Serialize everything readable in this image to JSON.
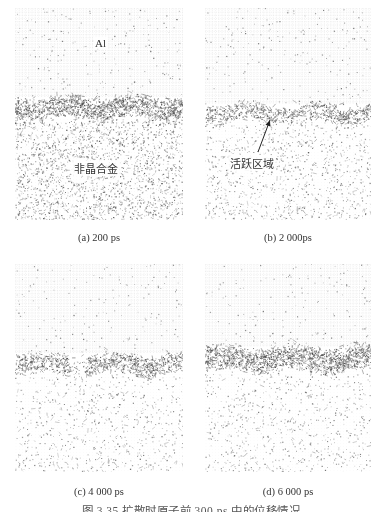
{
  "figure": {
    "caption": "图 3.35  扩散时原子前 300 ps 中的位移情况",
    "panels": [
      {
        "id": "a",
        "label": "(a) 200 ps",
        "x": 15,
        "y": 8,
        "w": 168,
        "h": 212,
        "interface_y": 100,
        "band_thickness": 22,
        "band_density": 1.0,
        "lower_density": 0.75,
        "upper_density": 0.12,
        "gap": null,
        "annotations": [
          {
            "text": "Al",
            "x": 93,
            "y": 45
          },
          {
            "text": "非晶合金",
            "x": 72,
            "y": 168
          }
        ]
      },
      {
        "id": "b",
        "label": "(b) 2 000ps",
        "x": 205,
        "y": 8,
        "w": 166,
        "h": 212,
        "interface_y": 105,
        "band_thickness": 18,
        "band_density": 0.7,
        "lower_density": 0.35,
        "upper_density": 0.12,
        "gap": null,
        "annotations": [
          {
            "text": "活跃区域",
            "x": 228,
            "y": 163
          }
        ],
        "arrow": {
          "from_x": 258,
          "from_y": 152,
          "to_x": 270,
          "to_y": 120
        }
      },
      {
        "id": "c",
        "label": "(c) 4 000 ps",
        "x": 15,
        "y": 264,
        "w": 168,
        "h": 208,
        "interface_y": 100,
        "band_thickness": 20,
        "band_density": 0.8,
        "lower_density": 0.25,
        "upper_density": 0.1,
        "gap": [
          55,
          70
        ],
        "annotations": []
      },
      {
        "id": "d",
        "label": "(d) 6 000 ps",
        "x": 205,
        "y": 264,
        "w": 166,
        "h": 208,
        "interface_y": 95,
        "band_thickness": 24,
        "band_density": 1.0,
        "lower_density": 0.25,
        "upper_density": 0.1,
        "gap": null,
        "annotations": []
      }
    ],
    "label_positions": [
      {
        "x": 99,
        "y": 232
      },
      {
        "x": 288,
        "y": 232
      },
      {
        "x": 99,
        "y": 486
      },
      {
        "x": 288,
        "y": 486
      }
    ],
    "colors": {
      "atom": "#444444",
      "lattice": "#9a9a9a",
      "background": "#ffffff"
    }
  }
}
